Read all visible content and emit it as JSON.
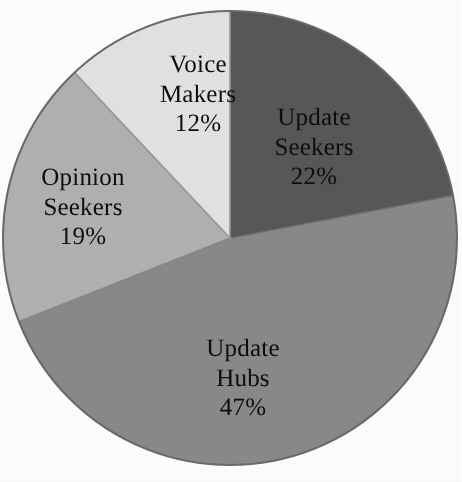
{
  "chart_data": {
    "type": "pie",
    "title": "",
    "subtitle": "",
    "xlabel": "",
    "ylabel": "",
    "legend_position": "none",
    "grid": false,
    "labels_inside_slices": true,
    "start_angle_deg": 0,
    "direction": "clockwise",
    "categories": [
      "Update Seekers",
      "Update Hubs",
      "Opinion Seekers",
      "Voice Makers"
    ],
    "values": [
      22,
      47,
      19,
      12
    ],
    "value_unit": "%",
    "total": 100,
    "colors": [
      "#585858",
      "#8a8a8a",
      "#b2b2b2",
      "#e4e4e4"
    ],
    "slices": [
      {
        "name": "Update Seekers",
        "name_line1": "Update",
        "name_line2": "Seekers",
        "value": 22,
        "value_label": "22%",
        "color": "#585858",
        "angle_deg": 79.2,
        "start_deg": 0,
        "end_deg": 79.2
      },
      {
        "name": "Update Hubs",
        "name_line1": "Update",
        "name_line2": "Hubs",
        "value": 47,
        "value_label": "47%",
        "color": "#8a8a8a",
        "angle_deg": 169.2,
        "start_deg": 79.2,
        "end_deg": 248.4
      },
      {
        "name": "Opinion Seekers",
        "name_line1": "Opinion",
        "name_line2": "Seekers",
        "value": 19,
        "value_label": "19%",
        "color": "#b2b2b2",
        "angle_deg": 68.4,
        "start_deg": 248.4,
        "end_deg": 316.8
      },
      {
        "name": "Voice Makers",
        "name_line1": "Voice",
        "name_line2": "Makers",
        "value": 12,
        "value_label": "12%",
        "color": "#e4e4e4",
        "angle_deg": 43.2,
        "start_deg": 316.8,
        "end_deg": 360
      }
    ]
  },
  "figure": {
    "background_color": "#ffffff",
    "outline_color": "#6b6b6b",
    "text_color": "#0d0d0d",
    "center_x": 230,
    "center_y": 238,
    "radius": 227
  }
}
